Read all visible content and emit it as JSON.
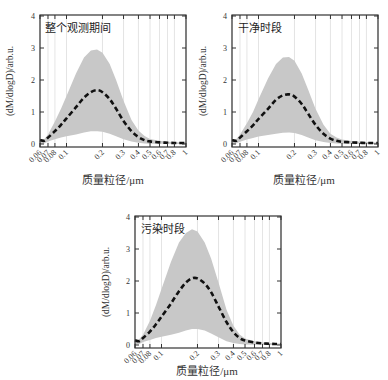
{
  "chart_data": [
    {
      "type": "area",
      "title": "整个观测期间",
      "xlabel": "质量粒径/μm",
      "ylabel": "(dM/dlogD)/arb.u.",
      "xscale": "log",
      "xlim": [
        0.06,
        1
      ],
      "ylim": [
        0,
        4
      ],
      "grid": "vertical",
      "xticks": [
        0.06,
        0.07,
        0.08,
        0.1,
        0.2,
        0.3,
        0.4,
        0.5,
        0.6,
        0.7,
        0.8,
        1
      ],
      "xtick_labels": [
        "0.06",
        "0.07",
        "0.08",
        "0.1",
        "0.2",
        "0.3",
        "0.4",
        "0.5",
        "0.6",
        "0.7",
        "0.8",
        "1"
      ],
      "yticks": [
        0,
        1,
        2,
        3,
        4
      ],
      "x": [
        0.06,
        0.065,
        0.07,
        0.08,
        0.09,
        0.1,
        0.12,
        0.14,
        0.16,
        0.18,
        0.2,
        0.23,
        0.26,
        0.3,
        0.35,
        0.4,
        0.45,
        0.5,
        0.6,
        0.7,
        0.8,
        0.9,
        1.0
      ],
      "series": [
        {
          "name": "mean",
          "style": "dashed",
          "values": [
            0.12,
            0.1,
            0.2,
            0.4,
            0.6,
            0.8,
            1.15,
            1.45,
            1.62,
            1.68,
            1.62,
            1.4,
            1.1,
            0.72,
            0.4,
            0.22,
            0.12,
            0.08,
            0.05,
            0.04,
            0.03,
            0.03,
            0.03
          ]
        },
        {
          "name": "upper",
          "values": [
            0.12,
            0.15,
            0.3,
            0.7,
            1.1,
            1.5,
            2.2,
            2.7,
            2.92,
            2.95,
            2.85,
            2.5,
            2.0,
            1.35,
            0.75,
            0.42,
            0.25,
            0.16,
            0.1,
            0.07,
            0.06,
            0.05,
            0.05
          ]
        },
        {
          "name": "lower",
          "values": [
            0.0,
            0.02,
            0.08,
            0.15,
            0.2,
            0.24,
            0.3,
            0.36,
            0.4,
            0.4,
            0.38,
            0.32,
            0.24,
            0.15,
            0.08,
            0.04,
            0.02,
            0.01,
            0.01,
            0.01,
            0.0,
            0.0,
            0.0
          ]
        }
      ]
    },
    {
      "type": "area",
      "title": "干净时段",
      "xlabel": "质量粒径/μm",
      "ylabel": "(dM/dlogD)/arb.u.",
      "xscale": "log",
      "xlim": [
        0.06,
        1
      ],
      "ylim": [
        0,
        4
      ],
      "grid": "vertical",
      "xticks": [
        0.06,
        0.07,
        0.08,
        0.1,
        0.2,
        0.3,
        0.4,
        0.5,
        0.6,
        0.7,
        0.8,
        1
      ],
      "xtick_labels": [
        "0.06",
        "0.07",
        "0.08",
        "0.1",
        "0.2",
        "0.3",
        "0.4",
        "0.5",
        "0.6",
        "0.7",
        "0.8",
        "1"
      ],
      "yticks": [
        0,
        1,
        2,
        3,
        4
      ],
      "x": [
        0.06,
        0.065,
        0.07,
        0.08,
        0.09,
        0.1,
        0.12,
        0.14,
        0.16,
        0.18,
        0.2,
        0.23,
        0.26,
        0.3,
        0.35,
        0.4,
        0.45,
        0.5,
        0.6,
        0.7,
        0.8,
        0.9,
        1.0
      ],
      "series": [
        {
          "name": "mean",
          "style": "dashed",
          "values": [
            0.12,
            0.1,
            0.2,
            0.4,
            0.58,
            0.78,
            1.1,
            1.38,
            1.52,
            1.55,
            1.48,
            1.25,
            0.95,
            0.6,
            0.32,
            0.17,
            0.1,
            0.07,
            0.05,
            0.04,
            0.03,
            0.03,
            0.03
          ]
        },
        {
          "name": "upper",
          "values": [
            0.12,
            0.15,
            0.3,
            0.65,
            1.0,
            1.4,
            2.05,
            2.5,
            2.7,
            2.72,
            2.6,
            2.2,
            1.7,
            1.1,
            0.6,
            0.32,
            0.2,
            0.14,
            0.09,
            0.07,
            0.06,
            0.05,
            0.05
          ]
        },
        {
          "name": "lower",
          "values": [
            0.0,
            0.02,
            0.07,
            0.14,
            0.19,
            0.23,
            0.28,
            0.32,
            0.35,
            0.36,
            0.34,
            0.28,
            0.2,
            0.12,
            0.06,
            0.03,
            0.02,
            0.01,
            0.01,
            0.01,
            0.0,
            0.0,
            0.0
          ]
        }
      ]
    },
    {
      "type": "area",
      "title": "污染时段",
      "xlabel": "质量粒径/μm",
      "ylabel": "(dM/dlogD)/arb.u.",
      "xscale": "log",
      "xlim": [
        0.06,
        1
      ],
      "ylim": [
        0,
        4
      ],
      "grid": "vertical",
      "xticks": [
        0.06,
        0.07,
        0.08,
        0.1,
        0.2,
        0.3,
        0.4,
        0.5,
        0.6,
        0.7,
        0.8,
        1
      ],
      "xtick_labels": [
        "0.06",
        "0.07",
        "0.08",
        "0.1",
        "0.2",
        "0.3",
        "0.4",
        "0.5",
        "0.6",
        "0.7",
        "0.8",
        "1"
      ],
      "yticks": [
        0,
        1,
        2,
        3,
        4
      ],
      "x": [
        0.06,
        0.065,
        0.07,
        0.08,
        0.09,
        0.1,
        0.12,
        0.14,
        0.16,
        0.18,
        0.2,
        0.23,
        0.26,
        0.3,
        0.35,
        0.4,
        0.45,
        0.5,
        0.6,
        0.7,
        0.8,
        0.9,
        1.0
      ],
      "series": [
        {
          "name": "mean",
          "style": "dashed",
          "values": [
            0.15,
            0.12,
            0.22,
            0.42,
            0.65,
            0.88,
            1.3,
            1.68,
            1.95,
            2.08,
            2.08,
            1.92,
            1.65,
            1.2,
            0.72,
            0.4,
            0.22,
            0.14,
            0.08,
            0.05,
            0.04,
            0.03,
            0.03
          ]
        },
        {
          "name": "upper",
          "values": [
            0.15,
            0.18,
            0.32,
            0.75,
            1.25,
            1.75,
            2.6,
            3.2,
            3.5,
            3.62,
            3.55,
            3.2,
            2.7,
            1.95,
            1.1,
            0.6,
            0.33,
            0.2,
            0.12,
            0.08,
            0.06,
            0.05,
            0.05
          ]
        },
        {
          "name": "lower",
          "values": [
            0.0,
            0.03,
            0.09,
            0.16,
            0.22,
            0.26,
            0.32,
            0.38,
            0.45,
            0.5,
            0.5,
            0.45,
            0.36,
            0.24,
            0.12,
            0.06,
            0.03,
            0.02,
            0.01,
            0.01,
            0.0,
            0.0,
            0.0
          ]
        }
      ]
    }
  ],
  "panels": [
    {
      "title": "整个观测期间",
      "xlabel": "质量粒径/μm",
      "ylabel": "(dM/dlogD)/arb.u."
    },
    {
      "title": "干净时段",
      "xlabel": "质量粒径/μm",
      "ylabel": "(dM/dlogD)/arb.u."
    },
    {
      "title": "污染时段",
      "xlabel": "质量粒径/μm",
      "ylabel": "(dM/dlogD)/arb.u."
    }
  ],
  "colors": {
    "band": "#c8c8c8",
    "mean_line": "#111111",
    "axis": "#333333",
    "grid": "#d9d9d9"
  }
}
